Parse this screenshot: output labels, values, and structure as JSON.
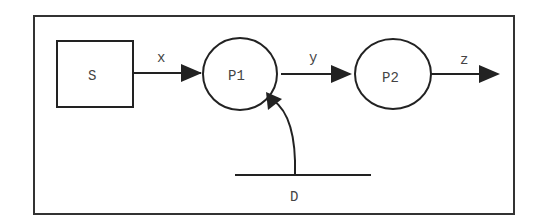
{
  "diagram": {
    "type": "data-flow",
    "nodes": {
      "source": {
        "label": "S",
        "shape": "rectangle"
      },
      "process1": {
        "label": "P1",
        "shape": "circle"
      },
      "process2": {
        "label": "P2",
        "shape": "circle"
      },
      "store": {
        "label": "D",
        "shape": "data-store"
      }
    },
    "edges": {
      "s_to_p1": {
        "label": "x"
      },
      "p1_to_p2": {
        "label": "y"
      },
      "p2_out": {
        "label": "z"
      },
      "d_to_p1": {
        "label": ""
      }
    },
    "colors": {
      "stroke": "#222222",
      "text": "#444444",
      "background": "#ffffff"
    }
  }
}
